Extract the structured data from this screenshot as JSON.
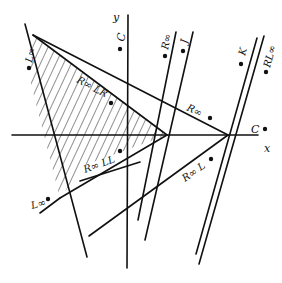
{
  "diagram": {
    "axes": {
      "x_label": "x",
      "y_label": "y"
    },
    "regions": [
      {
        "id": "C_top",
        "label": "C"
      },
      {
        "id": "L_inf",
        "label": "L∞"
      },
      {
        "id": "R_inf_LR",
        "label": "R∞ LR"
      },
      {
        "id": "R_inf_top",
        "label": "R∞"
      },
      {
        "id": "J",
        "label": "J"
      },
      {
        "id": "K",
        "label": "K"
      },
      {
        "id": "RL_inf",
        "label": "RL∞"
      },
      {
        "id": "R_inf_mid",
        "label": "R∞"
      },
      {
        "id": "C_right",
        "label": "C"
      },
      {
        "id": "R_inf_LL",
        "label": "R∞ LL"
      },
      {
        "id": "L_inf_bottom",
        "label": "L∞"
      },
      {
        "id": "R_inf_L",
        "label": "R∞ L"
      }
    ],
    "line_color": "#111111",
    "hatch_color": "#222222"
  }
}
